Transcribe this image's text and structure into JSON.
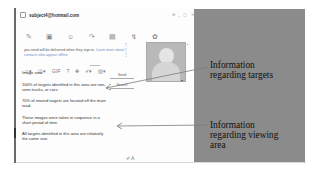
{
  "window": {
    "title": "subject4@hotmail.com",
    "controls": "⊟ _ ▢ ✕"
  },
  "toolbar": {
    "icons": [
      "✎",
      "▣",
      "☺",
      "↷",
      "▤",
      "↯",
      "✿"
    ]
  },
  "notice": {
    "text": "you send will be delivered when they sign in.",
    "link": "Learn more about contacts who appear offline"
  },
  "format_bar": {
    "items": [
      "☺▾",
      "◫▾",
      "GIF",
      "?",
      "✥",
      "✐▾",
      "▧▾"
    ]
  },
  "chat": {
    "sender_line": "Image sent",
    "messages": [
      "100% of targets identified in this area are non-semi trucks, or cars.",
      "70% of moved targets are located off the main road.",
      "These images were taken in sequence in a short period of time.",
      "All targets identified in this area are relatively the same size."
    ],
    "send_label": "Send",
    "search_label": "Search"
  },
  "side": {
    "dots": [
      "⋮",
      "⋮",
      "⋮"
    ],
    "scroll_icon": "▾",
    "avatar_alt": "contact avatar"
  },
  "bottom_icons": "✐ A",
  "annotations": {
    "targets": [
      "Information",
      "regarding targets"
    ],
    "viewing": [
      "Information",
      "regarding viewing",
      "area"
    ]
  },
  "colors": {
    "panel_bg": "#8b8b8b",
    "window_bg": "#fdfdfd",
    "arrow": "#7c7c7c"
  }
}
